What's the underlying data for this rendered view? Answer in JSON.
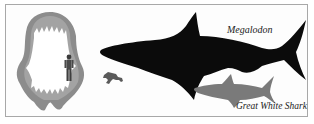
{
  "figure": {
    "labels": {
      "megalodon": "Megalodon",
      "great_white": "Great White Shark"
    },
    "elements": [
      "megalodon-jaw-reconstruction-with-person",
      "diver-silhouette",
      "megalodon-silhouette",
      "great-white-shark-silhouette"
    ],
    "colors": {
      "megalodon": "#0a0a0a",
      "great_white": "#7a7a7a",
      "jaw": "#8a8a8a",
      "frame": "#a8a8a8",
      "background": "#fdfdfd"
    }
  }
}
